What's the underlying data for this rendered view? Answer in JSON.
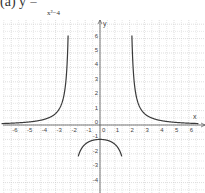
{
  "title": {
    "label": "(a)  y =",
    "denominator": "x²−4"
  },
  "axes": {
    "x_label": "x",
    "y_label": "y"
  },
  "colors": {
    "curve": "#3a3a3a",
    "grid": "#c8c8c8",
    "axis": "#555555",
    "background": "#ffffff"
  },
  "chart_data": {
    "type": "line",
    "xlabel": "x",
    "ylabel": "y",
    "xlim": [
      -6.5,
      6.5
    ],
    "ylim": [
      -4.7,
      7.2
    ],
    "grid": true,
    "x_ticks": [
      -6,
      -5,
      -4,
      -3,
      -2,
      -1,
      0,
      1,
      2,
      3,
      4,
      5,
      6
    ],
    "y_ticks": [
      -4,
      -3,
      -2,
      -1,
      0,
      1,
      2,
      3,
      4,
      5,
      6
    ],
    "vertical_asymptotes": [
      -2,
      2
    ],
    "horizontal_asymptote": 0,
    "series": [
      {
        "name": "left branch",
        "x": [
          -6.5,
          -6,
          -5,
          -4,
          -3,
          -2.5,
          -2.3,
          -2.2,
          -2.15
        ],
        "y": [
          1.1,
          1.13,
          1.19,
          1.33,
          1.8,
          2.78,
          4.0,
          5.0,
          6.0
        ]
      },
      {
        "name": "middle branch",
        "x": [
          -1.45,
          -1.2,
          -1,
          -0.5,
          0,
          0.5,
          1,
          1.2,
          1.45
        ],
        "y": [
          -4.2,
          -2.0,
          -1.33,
          -1.07,
          -1.0,
          -1.07,
          -1.33,
          -2.0,
          -4.2
        ]
      },
      {
        "name": "right branch",
        "x": [
          2.15,
          2.2,
          2.3,
          2.5,
          3,
          4,
          5,
          6,
          6.5
        ],
        "y": [
          6.0,
          5.0,
          4.0,
          2.78,
          1.8,
          1.33,
          1.19,
          1.13,
          1.1
        ]
      }
    ]
  }
}
